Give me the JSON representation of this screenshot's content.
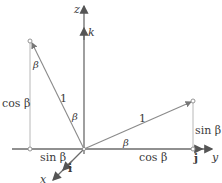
{
  "diagram": {
    "axes": {
      "z_label": "z",
      "y_label": "y",
      "x_label": "x",
      "k_label": "k",
      "j_label": "j",
      "i_label": "i"
    },
    "left_vector": {
      "length_label": "1",
      "angle_label_at_origin": "β",
      "angle_label_at_tip": "β",
      "vertical_component_label": "cos β",
      "horizontal_component_label": "sin β"
    },
    "right_vector": {
      "length_label": "1",
      "angle_label_at_origin": "β",
      "vertical_component_label": "sin β",
      "horizontal_component_label": "cos β"
    },
    "colors": {
      "axis": "#6b6b6b",
      "vector": "#8a8a8a",
      "guide": "#b8b8b8",
      "text": "#3a3a3a"
    }
  }
}
